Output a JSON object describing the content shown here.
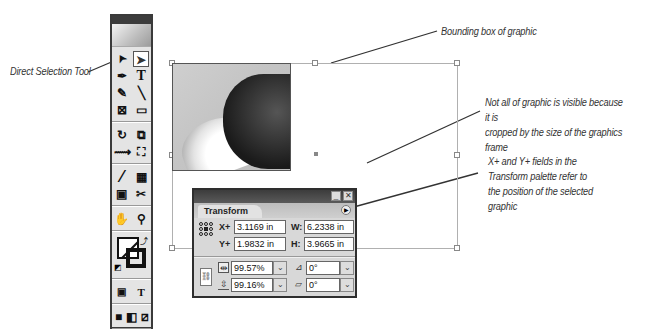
{
  "callouts": {
    "direct_selection": "Direct Selection Tool",
    "bounding_box": "Bounding box of graphic",
    "not_visible": [
      "Not all of graphic is visible because it is",
      "cropped by the size of the graphics frame"
    ],
    "xy_fields": [
      "X+ and Y+ fields in the",
      "Transform palette refer to",
      "the position of the selected",
      "graphic"
    ]
  },
  "toolbox": {
    "rows": [
      [
        "selection-tool",
        "direct-selection-tool"
      ],
      [
        "pen-tool",
        "type-tool"
      ],
      [
        "pencil-tool",
        "line-tool"
      ],
      [
        "rectangle-frame-tool",
        "rectangle-tool"
      ],
      [
        "rotate-tool",
        "scale-tool"
      ],
      [
        "shear-tool",
        "free-transform-tool"
      ],
      [
        "eyedropper-tool",
        "gradient-tool"
      ],
      [
        "button-tool",
        "scissors-tool"
      ],
      [
        "hand-tool",
        "zoom-tool"
      ]
    ],
    "glyphs": {
      "selection-tool": "➤",
      "direct-selection-tool": "➤",
      "pen-tool": "✒",
      "type-tool": "T",
      "pencil-tool": "✎",
      "line-tool": "╲",
      "rectangle-frame-tool": "⊠",
      "rectangle-tool": "▭",
      "rotate-tool": "↻",
      "scale-tool": "⧉",
      "shear-tool": "⟿",
      "free-transform-tool": "⛶",
      "eyedropper-tool": "⁄",
      "gradient-tool": "▦",
      "button-tool": "▣",
      "scissors-tool": "✂",
      "hand-tool": "✋",
      "zoom-tool": "⚲",
      "formatting-container": "▣",
      "formatting-text": "T",
      "apply-color": "■",
      "apply-gradient": "◧",
      "apply-none": "⧄",
      "normal-view": "▣",
      "preview-view": "▣"
    },
    "selected_tool": "direct-selection-tool"
  },
  "transform": {
    "title": "Transform",
    "x_label": "X+",
    "x_value": "3.1169 in",
    "y_label": "Y+",
    "y_value": "1.9832 in",
    "w_label": "W:",
    "w_value": "6.2338 in",
    "h_label": "H:",
    "h_value": "3.9665 in",
    "scale_x": "99.57%",
    "scale_y": "99.16%",
    "rotation": "0°",
    "shear": "0°",
    "minimize": "_",
    "close": "✕",
    "menu": "▶",
    "dropdown": "⌄"
  }
}
